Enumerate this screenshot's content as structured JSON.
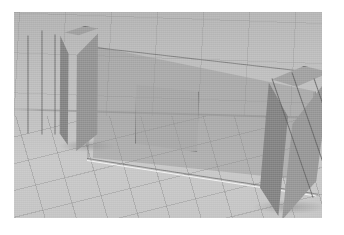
{
  "app": {
    "kind": "3d-modeling-viewport",
    "background_color": "#ffffff"
  },
  "viewport": {
    "label": "3D perspective viewport",
    "background_color": "#c0c0c0",
    "ground_color": "#c5c5c5",
    "grid_line_color": "#828282",
    "grid_visible": "true",
    "projection": "perspective"
  },
  "scene": {
    "description": "Grey shaded 3D model of a translucent wall panel with a square opening, flanked by two rectangular columns standing on a gridded ground plane.",
    "objects": [
      {
        "name": "left-column",
        "type": "box",
        "fill_color": "#8f8f8f",
        "top_face_color": "#9f9f9f",
        "edge_color": "#626262"
      },
      {
        "name": "wall-panel",
        "type": "slab",
        "fill_color": "#929292",
        "opacity": "0.46",
        "edge_color": "#707070",
        "highlight_color": "#fcfcfc"
      },
      {
        "name": "wall-opening",
        "type": "rectangular-opening",
        "fill_color": "#a0a0a0",
        "edge_color": "#6c6c6c"
      },
      {
        "name": "right-column",
        "type": "box",
        "fill_color": "#909090",
        "top_face_color": "#a2a2a2",
        "edge_color": "#606060"
      },
      {
        "name": "ground-plane",
        "type": "grid",
        "fill_color": "#c5c5c5",
        "edge_color": "#828282"
      }
    ]
  }
}
